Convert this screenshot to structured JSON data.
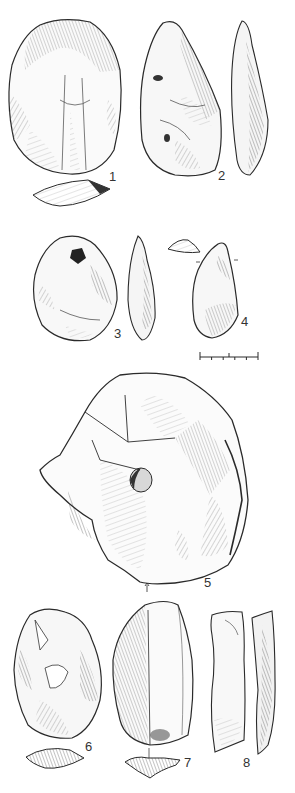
{
  "figure": {
    "type": "archaeological-illustration",
    "colors": {
      "ink": "#2a2a2a",
      "shade": "#8a8a8a",
      "paper": "#ffffff"
    }
  },
  "artifacts": [
    {
      "id": "1",
      "label": "1",
      "views": [
        "face",
        "section"
      ]
    },
    {
      "id": "2",
      "label": "2",
      "views": [
        "face",
        "profile"
      ]
    },
    {
      "id": "3",
      "label": "3",
      "views": [
        "face",
        "profile"
      ]
    },
    {
      "id": "4",
      "label": "4",
      "views": [
        "face",
        "section"
      ]
    },
    {
      "id": "5",
      "label": "5",
      "views": [
        "face"
      ]
    },
    {
      "id": "6",
      "label": "6",
      "views": [
        "face",
        "section"
      ]
    },
    {
      "id": "7",
      "label": "7",
      "views": [
        "face",
        "section"
      ]
    },
    {
      "id": "8",
      "label": "8",
      "views": [
        "face",
        "profile"
      ]
    }
  ],
  "scale_bar": {
    "segments": 5
  }
}
